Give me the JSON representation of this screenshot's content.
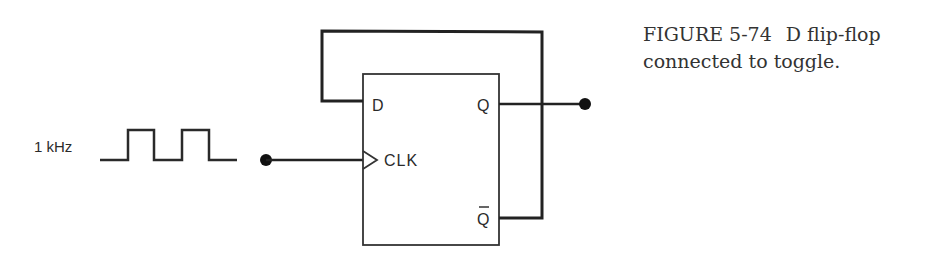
{
  "caption": {
    "figure_number": "FIGURE 5-74",
    "text": "D flip-flop connected to toggle."
  },
  "diagram": {
    "type": "digital logic schematic",
    "colors": {
      "line": "#222222",
      "background": "#ffffff",
      "caption": "#333333"
    },
    "clock_source": {
      "label": "1 kHz",
      "waveform": "square-wave"
    },
    "flip_flop": {
      "type": "D flip-flop",
      "pins": {
        "d": "D",
        "clk": "CLK",
        "q": "Q",
        "q_bar": "Q"
      }
    },
    "connections": [
      "Q̄ output fed back to D input",
      "Clock input driven by 1 kHz square wave",
      "Q output to output terminal"
    ]
  }
}
